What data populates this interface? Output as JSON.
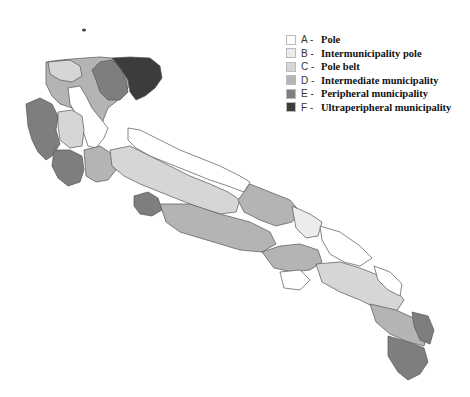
{
  "legend": {
    "items": [
      {
        "code": "A -",
        "label": "Pole",
        "color": "#ffffff"
      },
      {
        "code": "B -",
        "label": "Intermunicipality pole",
        "color": "#ececec"
      },
      {
        "code": "C -",
        "label": "Pole belt",
        "color": "#d6d6d6"
      },
      {
        "code": "D -",
        "label": "Intermediate municipality",
        "color": "#b4b4b4"
      },
      {
        "code": "E -",
        "label": "Peripheral municipality",
        "color": "#7e7e7e"
      },
      {
        "code": "F -",
        "label": "Ultraperipheral municipality",
        "color": "#3c3c3c"
      }
    ]
  },
  "map": {
    "region": "Apulia municipalities classification",
    "stroke": "#555555"
  }
}
